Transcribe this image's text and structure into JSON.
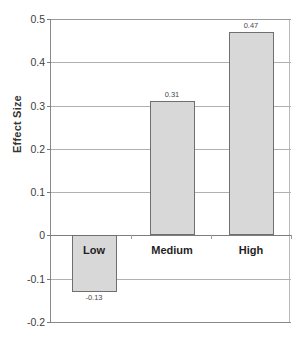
{
  "chart_data": {
    "type": "bar",
    "title": "",
    "xlabel": "",
    "ylabel": "Effect Size",
    "categories": [
      "Low",
      "Medium",
      "High"
    ],
    "values": [
      -0.13,
      0.31,
      0.47
    ],
    "value_labels": [
      "-0.13",
      "0.31",
      "0.47"
    ],
    "ylim": [
      -0.2,
      0.5
    ],
    "yticks": [
      0.5,
      0.4,
      0.3,
      0.2,
      0.1,
      0,
      -0.1,
      -0.2
    ],
    "ytick_labels": [
      "0.5",
      "0.4",
      "0.3",
      "0.2",
      "0.1",
      "0",
      "-0.1",
      "-0.2"
    ],
    "grid": true,
    "legend": false,
    "bar_color": "#d8d8d8",
    "bar_border_color": "#6f6f6f",
    "gridline_color": "#b0b0b0",
    "axis_color": "#8a8a8a",
    "background": "#ffffff"
  }
}
